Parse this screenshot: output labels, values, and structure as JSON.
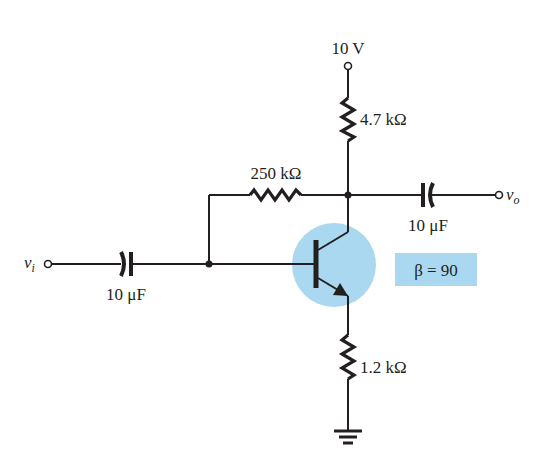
{
  "diagram": {
    "type": "circuit",
    "colors": {
      "wire": "#231f20",
      "highlight": "#a9d8f0",
      "background": "#ffffff"
    },
    "supply": {
      "label": "10 V"
    },
    "components": {
      "rc": {
        "label": "4.7 kΩ"
      },
      "rf": {
        "label": "250 kΩ"
      },
      "re": {
        "label": "1.2 kΩ"
      },
      "c_in": {
        "label": "10 μF"
      },
      "c_out": {
        "label": "10 μF"
      },
      "transistor": {
        "type": "npn",
        "beta_label": "β = 90"
      }
    },
    "terminals": {
      "input": {
        "symbol": "v",
        "subscript": "i"
      },
      "output": {
        "symbol": "v",
        "subscript": "o"
      }
    }
  }
}
